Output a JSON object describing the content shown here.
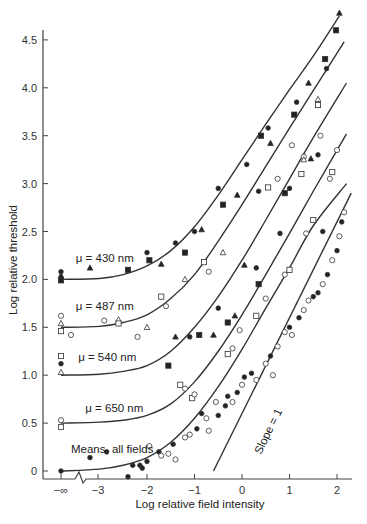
{
  "chart_data": {
    "type": "scatter",
    "title": "",
    "xlabel": "Log relative field intensity",
    "ylabel": "Log relative threshold",
    "x_ticks": [
      "−∞",
      "−3",
      "−2",
      "−1",
      "0",
      "1",
      "2"
    ],
    "x_tick_values": [
      null,
      -3,
      -2,
      -1,
      0,
      1,
      2
    ],
    "y_ticks": [
      "0",
      "0.5",
      "1.0",
      "1.5",
      "2.0",
      "2.5",
      "3.0",
      "3.5",
      "4.0",
      "4.5"
    ],
    "y_tick_values": [
      0,
      0.5,
      1.0,
      1.5,
      2.0,
      2.5,
      3.0,
      3.5,
      4.0,
      4.5
    ],
    "xlim": [
      -3.8,
      2.3
    ],
    "ylim": [
      -0.1,
      4.7
    ],
    "axis_break": "between −∞ and −3",
    "grid": false,
    "legend": "none (curves labeled inline)",
    "reference_line": {
      "label": "Slope = 1",
      "x": [
        -0.6,
        2.3
      ],
      "y": [
        0.0,
        2.9
      ]
    },
    "series": [
      {
        "name": "μ = 430 nm",
        "label_pos": [
          -3.5,
          2.18
        ],
        "curve": [
          [
            -3.9,
            2.0
          ],
          [
            -3.0,
            2.01
          ],
          [
            -2.5,
            2.05
          ],
          [
            -2.0,
            2.14
          ],
          [
            -1.5,
            2.3
          ],
          [
            -1.0,
            2.55
          ],
          [
            -0.5,
            2.88
          ],
          [
            0,
            3.25
          ],
          [
            0.5,
            3.62
          ],
          [
            1.0,
            3.98
          ],
          [
            1.5,
            4.33
          ],
          [
            2.05,
            4.75
          ]
        ],
        "points": [
          {
            "x": -3.9,
            "y": 2.08,
            "m": "filled-circle"
          },
          {
            "x": -3.9,
            "y": 2.04,
            "m": "filled-triangle"
          },
          {
            "x": -3.9,
            "y": 1.99,
            "m": "filled-square"
          },
          {
            "x": -2.4,
            "y": 2.1,
            "m": "filled-square"
          },
          {
            "x": -2.0,
            "y": 2.28,
            "m": "filled-circle"
          },
          {
            "x": -1.95,
            "y": 2.2,
            "m": "filled-square"
          },
          {
            "x": -1.7,
            "y": 2.16,
            "m": "filled-triangle"
          },
          {
            "x": -1.2,
            "y": 2.28,
            "m": "filled-square"
          },
          {
            "x": -1.0,
            "y": 2.5,
            "m": "filled-circle"
          },
          {
            "x": -0.85,
            "y": 2.52,
            "m": "filled-triangle"
          },
          {
            "x": -0.5,
            "y": 2.95,
            "m": "filled-circle"
          },
          {
            "x": -0.4,
            "y": 2.78,
            "m": "filled-square"
          },
          {
            "x": -0.1,
            "y": 2.88,
            "m": "filled-triangle"
          },
          {
            "x": 0.1,
            "y": 3.2,
            "m": "filled-circle"
          },
          {
            "x": 0.4,
            "y": 3.5,
            "m": "filled-square"
          },
          {
            "x": 0.55,
            "y": 3.58,
            "m": "filled-circle"
          },
          {
            "x": 0.6,
            "y": 3.42,
            "m": "filled-triangle"
          },
          {
            "x": 1.15,
            "y": 3.85,
            "m": "filled-circle"
          },
          {
            "x": 1.1,
            "y": 3.72,
            "m": "filled-square"
          },
          {
            "x": 1.4,
            "y": 4.05,
            "m": "filled-triangle"
          },
          {
            "x": 1.75,
            "y": 4.3,
            "m": "filled-square"
          },
          {
            "x": 1.78,
            "y": 4.2,
            "m": "filled-circle"
          },
          {
            "x": 2.05,
            "y": 4.78,
            "m": "filled-triangle"
          },
          {
            "x": 1.98,
            "y": 4.6,
            "m": "filled-square"
          },
          {
            "x": -3.2,
            "y": 2.12,
            "m": "filled-triangle"
          }
        ]
      },
      {
        "name": "μ = 487 nm",
        "label_pos": [
          -3.5,
          1.68
        ],
        "curve": [
          [
            -3.9,
            1.5
          ],
          [
            -3.0,
            1.51
          ],
          [
            -2.5,
            1.55
          ],
          [
            -2.0,
            1.63
          ],
          [
            -1.5,
            1.8
          ],
          [
            -1.0,
            2.05
          ],
          [
            -0.5,
            2.4
          ],
          [
            0,
            2.78
          ],
          [
            0.5,
            3.18
          ],
          [
            1.0,
            3.58
          ],
          [
            1.5,
            3.97
          ],
          [
            2.15,
            4.48
          ]
        ],
        "points": [
          {
            "x": -3.9,
            "y": 1.62,
            "m": "open-circle"
          },
          {
            "x": -3.9,
            "y": 1.54,
            "m": "open-triangle"
          },
          {
            "x": -3.9,
            "y": 1.46,
            "m": "open-square"
          },
          {
            "x": -3.6,
            "y": 1.42,
            "m": "open-circle"
          },
          {
            "x": -2.9,
            "y": 1.57,
            "m": "open-circle"
          },
          {
            "x": -2.6,
            "y": 1.58,
            "m": "open-triangle"
          },
          {
            "x": -2.6,
            "y": 1.54,
            "m": "open-square"
          },
          {
            "x": -2.2,
            "y": 1.4,
            "m": "open-circle"
          },
          {
            "x": -2.0,
            "y": 1.5,
            "m": "open-triangle"
          },
          {
            "x": -1.7,
            "y": 1.82,
            "m": "open-square"
          },
          {
            "x": -1.6,
            "y": 1.72,
            "m": "open-circle"
          },
          {
            "x": -1.4,
            "y": 2.38,
            "m": "filled-circle"
          },
          {
            "x": -1.2,
            "y": 2.0,
            "m": "open-triangle"
          },
          {
            "x": -0.8,
            "y": 2.18,
            "m": "open-square"
          },
          {
            "x": -0.7,
            "y": 2.08,
            "m": "open-circle"
          },
          {
            "x": -0.4,
            "y": 2.28,
            "m": "open-triangle"
          },
          {
            "x": 0.35,
            "y": 2.92,
            "m": "filled-circle"
          },
          {
            "x": 0.55,
            "y": 2.96,
            "m": "open-square"
          },
          {
            "x": 0.75,
            "y": 3.05,
            "m": "open-circle"
          },
          {
            "x": 1.05,
            "y": 3.4,
            "m": "open-circle"
          },
          {
            "x": 1.25,
            "y": 3.1,
            "m": "open-square"
          },
          {
            "x": 1.3,
            "y": 3.28,
            "m": "open-circle"
          },
          {
            "x": 1.6,
            "y": 3.82,
            "m": "open-square"
          },
          {
            "x": 1.6,
            "y": 3.88,
            "m": "open-triangle"
          },
          {
            "x": 1.65,
            "y": 3.5,
            "m": "open-circle"
          },
          {
            "x": 1.3,
            "y": 3.25,
            "m": "open-triangle"
          }
        ]
      },
      {
        "name": "μ = 540 nm",
        "label_pos": [
          -3.45,
          1.15
        ],
        "curve": [
          [
            -3.9,
            1.0
          ],
          [
            -3.0,
            1.01
          ],
          [
            -2.5,
            1.04
          ],
          [
            -2.0,
            1.1
          ],
          [
            -1.5,
            1.25
          ],
          [
            -1.0,
            1.5
          ],
          [
            -0.5,
            1.82
          ],
          [
            0,
            2.2
          ],
          [
            0.5,
            2.62
          ],
          [
            1.0,
            3.05
          ],
          [
            1.5,
            3.48
          ],
          [
            2.2,
            4.05
          ]
        ],
        "points": [
          {
            "x": -3.9,
            "y": 1.2,
            "m": "open-square"
          },
          {
            "x": -3.9,
            "y": 1.12,
            "m": "filled-circle"
          },
          {
            "x": -3.9,
            "y": 1.03,
            "m": "open-triangle"
          },
          {
            "x": -1.55,
            "y": 1.1,
            "m": "filled-square"
          },
          {
            "x": -1.1,
            "y": 1.4,
            "m": "filled-circle"
          },
          {
            "x": -0.9,
            "y": 1.42,
            "m": "filled-square"
          },
          {
            "x": -1.4,
            "y": 1.4,
            "m": "filled-triangle"
          },
          {
            "x": -0.6,
            "y": 1.42,
            "m": "filled-triangle"
          },
          {
            "x": -0.5,
            "y": 1.7,
            "m": "filled-circle"
          },
          {
            "x": -0.3,
            "y": 1.55,
            "m": "filled-square"
          },
          {
            "x": -0.15,
            "y": 1.62,
            "m": "filled-triangle"
          },
          {
            "x": 0.05,
            "y": 2.15,
            "m": "filled-triangle"
          },
          {
            "x": 0.3,
            "y": 2.12,
            "m": "filled-circle"
          },
          {
            "x": 0.35,
            "y": 1.95,
            "m": "filled-square"
          },
          {
            "x": 0.8,
            "y": 2.48,
            "m": "filled-circle"
          },
          {
            "x": 0.9,
            "y": 2.9,
            "m": "filled-square"
          },
          {
            "x": 1.0,
            "y": 2.95,
            "m": "filled-circle"
          },
          {
            "x": 1.45,
            "y": 3.26,
            "m": "filled-triangle"
          },
          {
            "x": 1.6,
            "y": 3.3,
            "m": "filled-circle"
          },
          {
            "x": 1.7,
            "y": 2.5,
            "m": "filled-circle"
          }
        ]
      },
      {
        "name": "μ = 650 nm",
        "label_pos": [
          -3.3,
          0.62
        ],
        "curve": [
          [
            -3.9,
            0.5
          ],
          [
            -3.0,
            0.51
          ],
          [
            -2.5,
            0.53
          ],
          [
            -2.0,
            0.58
          ],
          [
            -1.5,
            0.7
          ],
          [
            -1.0,
            0.93
          ],
          [
            -0.5,
            1.25
          ],
          [
            0,
            1.63
          ],
          [
            0.5,
            2.05
          ],
          [
            1.0,
            2.48
          ],
          [
            1.5,
            2.92
          ],
          [
            2.2,
            3.52
          ]
        ],
        "points": [
          {
            "x": -3.9,
            "y": 0.53,
            "m": "open-circle"
          },
          {
            "x": -3.9,
            "y": 0.46,
            "m": "open-square"
          },
          {
            "x": -1.3,
            "y": 0.9,
            "m": "open-square"
          },
          {
            "x": -1.2,
            "y": 0.86,
            "m": "open-circle"
          },
          {
            "x": -1.05,
            "y": 0.76,
            "m": "open-square"
          },
          {
            "x": -1.0,
            "y": 0.8,
            "m": "open-circle"
          },
          {
            "x": -0.2,
            "y": 1.28,
            "m": "open-circle"
          },
          {
            "x": -0.3,
            "y": 1.22,
            "m": "open-square"
          },
          {
            "x": -0.05,
            "y": 1.47,
            "m": "open-circle"
          },
          {
            "x": 0.3,
            "y": 1.62,
            "m": "open-square"
          },
          {
            "x": 0.5,
            "y": 1.8,
            "m": "open-circle"
          },
          {
            "x": 0.9,
            "y": 2.05,
            "m": "open-circle"
          },
          {
            "x": 1.0,
            "y": 2.1,
            "m": "open-square"
          },
          {
            "x": 1.35,
            "y": 2.48,
            "m": "open-circle"
          },
          {
            "x": 1.5,
            "y": 2.62,
            "m": "open-square"
          },
          {
            "x": 1.85,
            "y": 3.05,
            "m": "open-circle"
          },
          {
            "x": 1.9,
            "y": 3.12,
            "m": "open-square"
          },
          {
            "x": 2.0,
            "y": 3.35,
            "m": "open-circle"
          }
        ]
      },
      {
        "name": "Means, all fields",
        "label_pos": [
          -3.6,
          0.19
        ],
        "curve": [
          [
            -3.9,
            0.0
          ],
          [
            -3.0,
            0.02
          ],
          [
            -2.5,
            0.06
          ],
          [
            -2.0,
            0.14
          ],
          [
            -1.5,
            0.3
          ],
          [
            -1.0,
            0.55
          ],
          [
            -0.5,
            0.88
          ],
          [
            0,
            1.27
          ],
          [
            0.5,
            1.7
          ],
          [
            1.0,
            2.12
          ],
          [
            1.5,
            2.56
          ],
          [
            2.2,
            3.0
          ]
        ],
        "points": [
          {
            "x": -3.9,
            "y": 0.0,
            "m": "filled-circle"
          },
          {
            "x": -3.2,
            "y": 0.14,
            "m": "filled-circle"
          },
          {
            "x": -2.85,
            "y": 0.2,
            "m": "filled-circle"
          },
          {
            "x": -2.4,
            "y": -0.06,
            "m": "filled-circle"
          },
          {
            "x": -2.3,
            "y": 0.06,
            "m": "filled-circle"
          },
          {
            "x": -2.15,
            "y": 0.06,
            "m": "filled-circle"
          },
          {
            "x": -2.1,
            "y": 0.03,
            "m": "filled-circle"
          },
          {
            "x": -2.0,
            "y": 0.1,
            "m": "filled-circle"
          },
          {
            "x": -1.95,
            "y": 0.26,
            "m": "open-circle"
          },
          {
            "x": -1.75,
            "y": 0.2,
            "m": "filled-circle"
          },
          {
            "x": -1.7,
            "y": 0.16,
            "m": "open-circle"
          },
          {
            "x": -1.55,
            "y": 0.18,
            "m": "open-circle"
          },
          {
            "x": -1.45,
            "y": 0.28,
            "m": "filled-circle"
          },
          {
            "x": -1.4,
            "y": 0.12,
            "m": "open-circle"
          },
          {
            "x": -1.2,
            "y": 0.35,
            "m": "open-circle"
          },
          {
            "x": -1.1,
            "y": 0.38,
            "m": "open-circle"
          },
          {
            "x": -0.95,
            "y": 0.44,
            "m": "filled-circle"
          },
          {
            "x": -0.85,
            "y": 0.6,
            "m": "filled-circle"
          },
          {
            "x": -0.75,
            "y": 0.55,
            "m": "open-circle"
          },
          {
            "x": -0.7,
            "y": 0.42,
            "m": "open-circle"
          },
          {
            "x": -0.55,
            "y": 0.72,
            "m": "open-circle"
          },
          {
            "x": -0.5,
            "y": 0.58,
            "m": "filled-circle"
          },
          {
            "x": -0.35,
            "y": 0.68,
            "m": "filled-circle"
          },
          {
            "x": -0.3,
            "y": 0.78,
            "m": "filled-circle"
          },
          {
            "x": -0.2,
            "y": 0.72,
            "m": "open-circle"
          },
          {
            "x": -0.1,
            "y": 0.82,
            "m": "filled-circle"
          },
          {
            "x": 0.0,
            "y": 0.9,
            "m": "open-circle"
          },
          {
            "x": 0.05,
            "y": 0.98,
            "m": "filled-circle"
          },
          {
            "x": 0.2,
            "y": 1.02,
            "m": "filled-circle"
          },
          {
            "x": 0.3,
            "y": 0.95,
            "m": "open-circle"
          },
          {
            "x": 0.5,
            "y": 1.12,
            "m": "open-circle"
          },
          {
            "x": 0.6,
            "y": 1.2,
            "m": "filled-circle"
          },
          {
            "x": 0.65,
            "y": 1.0,
            "m": "open-circle"
          },
          {
            "x": 0.75,
            "y": 1.3,
            "m": "open-circle"
          },
          {
            "x": 0.9,
            "y": 1.45,
            "m": "open-circle"
          },
          {
            "x": 1.0,
            "y": 1.5,
            "m": "filled-circle"
          },
          {
            "x": 1.05,
            "y": 1.42,
            "m": "open-circle"
          },
          {
            "x": 1.2,
            "y": 1.6,
            "m": "filled-circle"
          },
          {
            "x": 1.3,
            "y": 1.68,
            "m": "open-circle"
          },
          {
            "x": 1.4,
            "y": 1.78,
            "m": "open-circle"
          },
          {
            "x": 1.5,
            "y": 1.82,
            "m": "filled-circle"
          },
          {
            "x": 1.6,
            "y": 1.86,
            "m": "filled-circle"
          },
          {
            "x": 1.7,
            "y": 1.95,
            "m": "open-circle"
          },
          {
            "x": 1.8,
            "y": 2.05,
            "m": "filled-circle"
          },
          {
            "x": 1.9,
            "y": 2.2,
            "m": "open-circle"
          },
          {
            "x": 2.0,
            "y": 2.3,
            "m": "filled-circle"
          },
          {
            "x": 2.05,
            "y": 2.45,
            "m": "open-circle"
          },
          {
            "x": 2.1,
            "y": 2.6,
            "m": "filled-circle"
          },
          {
            "x": 2.15,
            "y": 2.7,
            "m": "open-circle"
          }
        ]
      }
    ]
  }
}
